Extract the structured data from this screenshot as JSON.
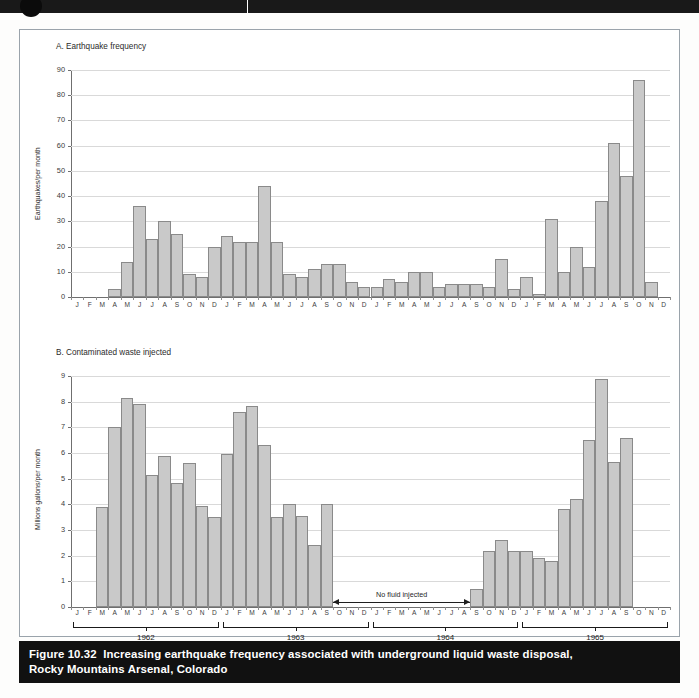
{
  "caption": {
    "figure_number": "Figure 10.32",
    "line1": "Increasing earthquake frequency associated with underground liquid waste disposal,",
    "line2": "Rocky Mountains Arsenal, Colorado"
  },
  "month_labels": [
    "J",
    "F",
    "M",
    "A",
    "M",
    "J",
    "J",
    "A",
    "S",
    "O",
    "N",
    "D"
  ],
  "years": [
    "1962",
    "1963",
    "1964",
    "1965"
  ],
  "annotation": {
    "no_fluid": "No fluid injected"
  },
  "chart_data": [
    {
      "type": "bar",
      "id": "panel-a",
      "title": "A. Earthquake frequency",
      "ylabel": "Earthquakes/per month",
      "xlabel": "",
      "ylim": [
        0,
        90
      ],
      "yticks": [
        0,
        10,
        20,
        30,
        40,
        50,
        60,
        70,
        80,
        90
      ],
      "grid": true,
      "legend": "none",
      "categories": [
        "1962-J",
        "1962-F",
        "1962-M",
        "1962-A",
        "1962-M",
        "1962-J",
        "1962-J",
        "1962-A",
        "1962-S",
        "1962-O",
        "1962-N",
        "1962-D",
        "1963-J",
        "1963-F",
        "1963-M",
        "1963-A",
        "1963-M",
        "1963-J",
        "1963-J",
        "1963-A",
        "1963-S",
        "1963-O",
        "1963-N",
        "1963-D",
        "1964-J",
        "1964-F",
        "1964-M",
        "1964-A",
        "1964-M",
        "1964-J",
        "1964-J",
        "1964-A",
        "1964-S",
        "1964-O",
        "1964-N",
        "1964-D",
        "1965-J",
        "1965-F",
        "1965-M",
        "1965-A",
        "1965-M",
        "1965-J",
        "1965-J",
        "1965-A",
        "1965-S",
        "1965-O",
        "1965-N",
        "1965-D"
      ],
      "values": [
        0,
        0,
        0,
        3,
        14,
        36,
        23,
        30,
        25,
        9,
        8,
        20,
        24,
        22,
        22,
        44,
        22,
        9,
        8,
        11,
        13,
        13,
        6,
        4,
        4,
        7,
        6,
        10,
        10,
        4,
        5,
        5,
        5,
        4,
        15,
        3,
        8,
        1,
        31,
        10,
        20,
        12,
        38,
        61,
        48,
        86,
        6,
        0
      ]
    },
    {
      "type": "bar",
      "id": "panel-b",
      "title": "B. Contaminated waste injected",
      "ylabel": "Millions gallons/per month",
      "xlabel": "",
      "ylim": [
        0,
        9
      ],
      "yticks": [
        0,
        1,
        2,
        3,
        4,
        5,
        6,
        7,
        8,
        9
      ],
      "grid": true,
      "legend": "none",
      "categories": [
        "1962-J",
        "1962-F",
        "1962-M",
        "1962-A",
        "1962-M",
        "1962-J",
        "1962-J",
        "1962-A",
        "1962-S",
        "1962-O",
        "1962-N",
        "1962-D",
        "1963-J",
        "1963-F",
        "1963-M",
        "1963-A",
        "1963-M",
        "1963-J",
        "1963-J",
        "1963-A",
        "1963-S",
        "1963-O",
        "1963-N",
        "1963-D",
        "1964-J",
        "1964-F",
        "1964-M",
        "1964-A",
        "1964-M",
        "1964-J",
        "1964-J",
        "1964-A",
        "1964-S",
        "1964-O",
        "1964-N",
        "1964-D",
        "1965-J",
        "1965-F",
        "1965-M",
        "1965-A",
        "1965-M",
        "1965-J",
        "1965-J",
        "1965-A",
        "1965-S",
        "1965-O",
        "1965-N",
        "1965-D"
      ],
      "values": [
        0,
        0,
        3.9,
        7.0,
        8.15,
        7.9,
        5.15,
        5.9,
        4.85,
        5.6,
        3.95,
        3.5,
        5.95,
        7.6,
        7.85,
        6.3,
        3.5,
        4.0,
        3.55,
        2.4,
        4.0,
        0,
        0,
        0,
        0,
        0,
        0,
        0,
        0,
        0,
        0,
        0,
        0.7,
        2.2,
        2.6,
        2.2,
        2.2,
        1.9,
        1.8,
        3.8,
        4.2,
        6.5,
        8.9,
        5.65,
        6.6,
        0,
        0,
        0
      ]
    }
  ]
}
